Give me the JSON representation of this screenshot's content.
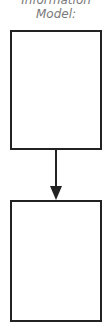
{
  "diagram": {
    "title_line1": "Information",
    "title_line2": "Model:",
    "nodes": [
      {
        "id": "box1",
        "label": ""
      },
      {
        "id": "box2",
        "label": ""
      }
    ],
    "edges": [
      {
        "from": "box1",
        "to": "box2",
        "type": "arrow"
      }
    ],
    "colors": {
      "stroke": "#222222",
      "title": "#7a7a7a",
      "background": "#ffffff"
    }
  }
}
